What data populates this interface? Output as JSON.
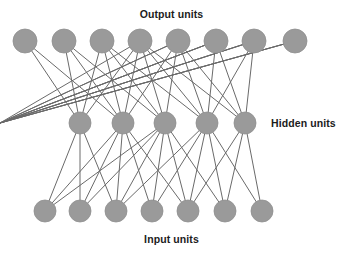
{
  "figure": {
    "background_color": "#ffffff",
    "width": 343,
    "height": 254
  },
  "labels": {
    "output": "Output units",
    "hidden": "Hidden units",
    "input": "Input units"
  },
  "style": {
    "node_fill": "#9a9a9a",
    "node_stroke": "#8f8f8f",
    "edge_color": "#6a6a6a",
    "edge_width": 1.0,
    "text_color": "#1c1c1c"
  },
  "chart_data": {
    "type": "diagram",
    "layers": [
      {
        "name": "output",
        "label": "Output units",
        "count": 8,
        "y": 41,
        "radius": 12,
        "x": [
          25,
          64,
          102,
          140,
          178,
          216,
          254,
          295
        ]
      },
      {
        "name": "hidden",
        "label": "Hidden units",
        "count": 5,
        "y": 123,
        "radius": 11,
        "x": [
          80,
          123,
          165,
          207,
          245
        ]
      },
      {
        "name": "input",
        "label": "Input units",
        "count": 7,
        "y": 211,
        "radius": 11,
        "x": [
          45,
          80,
          116,
          152,
          188,
          225,
          262
        ]
      }
    ],
    "edges": {
      "hidden_to_output": [
        [
          0,
          0
        ],
        [
          0,
          1
        ],
        [
          0,
          2
        ],
        [
          0,
          3
        ],
        [
          1,
          0
        ],
        [
          1,
          1
        ],
        [
          1,
          2
        ],
        [
          1,
          3
        ],
        [
          1,
          4
        ],
        [
          2,
          1
        ],
        [
          2,
          2
        ],
        [
          2,
          3
        ],
        [
          2,
          4
        ],
        [
          3,
          2
        ],
        [
          3,
          3
        ],
        [
          3,
          4
        ],
        [
          3,
          5
        ],
        [
          3,
          6
        ],
        [
          4,
          3
        ],
        [
          4,
          4
        ],
        [
          4,
          5
        ],
        [
          4,
          6
        ],
        [
          5,
          3
        ],
        [
          5,
          4
        ],
        [
          5,
          5
        ],
        [
          5,
          6
        ],
        [
          5,
          7
        ],
        [
          6,
          4
        ],
        [
          6,
          5
        ],
        [
          6,
          6
        ],
        [
          6,
          7
        ],
        [
          7,
          5
        ],
        [
          7,
          6
        ],
        [
          7,
          7
        ]
      ],
      "input_to_hidden": [
        [
          0,
          0
        ],
        [
          0,
          1
        ],
        [
          0,
          2
        ],
        [
          1,
          0
        ],
        [
          1,
          1
        ],
        [
          1,
          2
        ],
        [
          2,
          0
        ],
        [
          2,
          1
        ],
        [
          2,
          2
        ],
        [
          2,
          3
        ],
        [
          3,
          1
        ],
        [
          3,
          2
        ],
        [
          3,
          3
        ],
        [
          4,
          1
        ],
        [
          4,
          2
        ],
        [
          4,
          3
        ],
        [
          4,
          4
        ],
        [
          5,
          2
        ],
        [
          5,
          3
        ],
        [
          5,
          4
        ],
        [
          6,
          3
        ],
        [
          6,
          4
        ]
      ]
    }
  }
}
